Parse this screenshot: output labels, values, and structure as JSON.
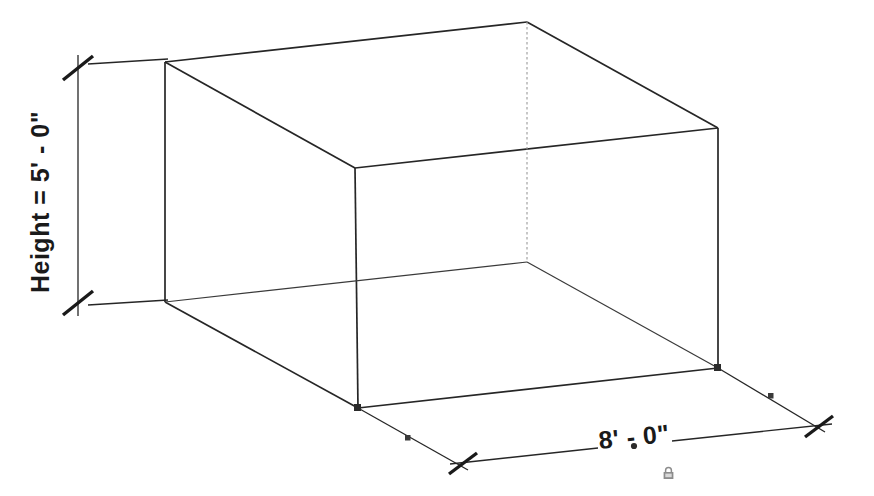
{
  "drawing": {
    "type": "isometric-box-dimension",
    "background_color": "#ffffff",
    "line_color": "#262626",
    "hidden_line_color": "#8a8a8a",
    "text_color": "#1a1a1a",
    "grip_color": "#3a3a3a",
    "lock_color": "#8c8c8c",
    "dimensions": {
      "height": {
        "label": "Height = 5' - 0\"",
        "value": "5' - 0\"",
        "orientation": "vertical",
        "rotation_deg": -90
      },
      "width": {
        "label": "8' - 0\"",
        "value": "8' - 0\"",
        "orientation": "horizontal-isometric",
        "rotation_deg": -5.8
      }
    },
    "icons": {
      "lock": "padlock-icon"
    },
    "box_vertices": {
      "top_back_left": [
        165,
        62
      ],
      "top_back_mid": [
        527,
        22
      ],
      "top_right": [
        718,
        128
      ],
      "top_front": [
        355,
        168
      ],
      "bottom_back_left": [
        165,
        302
      ],
      "bottom_hidden": [
        527,
        262
      ],
      "bottom_right": [
        718,
        368
      ],
      "bottom_front": [
        358,
        408
      ]
    }
  }
}
